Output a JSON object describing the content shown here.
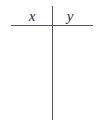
{
  "table": {
    "type": "t-table",
    "columns": [
      {
        "header": "x",
        "values": []
      },
      {
        "header": "y",
        "values": []
      }
    ],
    "colors": {
      "line": "#555555",
      "text": "#333333",
      "background": "#ffffff"
    }
  }
}
